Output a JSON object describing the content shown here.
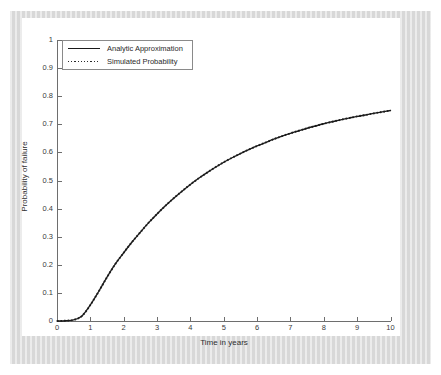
{
  "figure": {
    "frame_color": "#dcdcdc",
    "canvas_color": "#ffffff",
    "axis_color": "#6e6e6e"
  },
  "legend": {
    "position": "upper-left",
    "entries": [
      {
        "label": "Analytic Approximation",
        "style": "solid",
        "color": "#1a1a1a"
      },
      {
        "label": "Simulated Probability",
        "style": "dotted",
        "color": "#2a2a2a"
      }
    ]
  },
  "chart_data": {
    "type": "line",
    "title": "",
    "subtitle": "",
    "xlabel": "Time in years",
    "ylabel": "Probability of failure",
    "xlim": [
      0,
      10
    ],
    "ylim": [
      0,
      1
    ],
    "grid": false,
    "legend_position": "upper-left",
    "xticks": [
      0,
      1,
      2,
      3,
      4,
      5,
      6,
      7,
      8,
      9,
      10
    ],
    "xticklabels": [
      "0",
      "1",
      "2",
      "3",
      "4",
      "5",
      "6",
      "7",
      "8",
      "9",
      "10"
    ],
    "yticks": [
      0,
      0.1,
      0.2,
      0.3,
      0.4,
      0.5,
      0.6,
      0.7,
      0.8,
      0.9,
      1
    ],
    "yticklabels": [
      "0",
      "0.1",
      "0.2",
      "0.3",
      "0.4",
      "0.5",
      "0.6",
      "0.7",
      "0.8",
      "0.9",
      "1"
    ],
    "x": [
      0,
      0.25,
      0.5,
      0.75,
      1,
      1.25,
      1.5,
      1.75,
      2,
      2.25,
      2.5,
      2.75,
      3,
      3.25,
      3.5,
      3.75,
      4,
      4.25,
      4.5,
      4.75,
      5,
      5.25,
      5.5,
      5.75,
      6,
      6.25,
      6.5,
      6.75,
      7,
      7.25,
      7.5,
      7.75,
      8,
      8.25,
      8.5,
      8.75,
      9,
      9.25,
      9.5,
      9.75,
      10
    ],
    "series": [
      {
        "name": "Analytic Approximation",
        "style": "solid",
        "color": "#1a1a1a",
        "values": [
          0.0,
          0.001,
          0.004,
          0.018,
          0.057,
          0.105,
          0.156,
          0.203,
          0.243,
          0.281,
          0.316,
          0.35,
          0.381,
          0.41,
          0.437,
          0.462,
          0.486,
          0.508,
          0.528,
          0.547,
          0.565,
          0.581,
          0.596,
          0.61,
          0.623,
          0.635,
          0.647,
          0.658,
          0.668,
          0.677,
          0.686,
          0.694,
          0.702,
          0.709,
          0.716,
          0.722,
          0.728,
          0.733,
          0.739,
          0.744,
          0.749
        ]
      },
      {
        "name": "Simulated Probability",
        "style": "dotted",
        "color": "#2a2a2a",
        "values": [
          0.0,
          0.001,
          0.004,
          0.018,
          0.057,
          0.105,
          0.156,
          0.203,
          0.243,
          0.281,
          0.316,
          0.35,
          0.381,
          0.41,
          0.437,
          0.462,
          0.486,
          0.508,
          0.528,
          0.547,
          0.565,
          0.581,
          0.596,
          0.61,
          0.623,
          0.635,
          0.647,
          0.658,
          0.668,
          0.677,
          0.686,
          0.694,
          0.702,
          0.709,
          0.716,
          0.722,
          0.728,
          0.733,
          0.739,
          0.744,
          0.749
        ]
      }
    ]
  }
}
